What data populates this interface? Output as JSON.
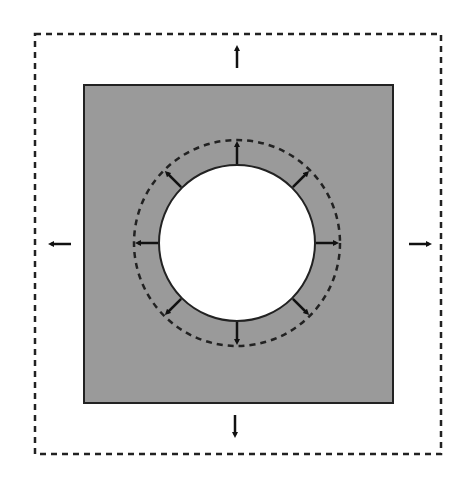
{
  "diagram": {
    "colors": {
      "background": "#ffffff",
      "plate_fill": "#9a9a9a",
      "plate_stroke": "#222222",
      "hole_fill": "#ffffff",
      "arrow": "#111111",
      "dashed": "#222222"
    },
    "outer_boundary": {
      "x": 35,
      "y": 34,
      "width": 406,
      "height": 420,
      "style": "dashed"
    },
    "plate": {
      "x": 84,
      "y": 85,
      "width": 309,
      "height": 318
    },
    "hole": {
      "cx": 237,
      "cy": 243,
      "r": 78
    },
    "expanded_hole": {
      "cx": 237,
      "cy": 243,
      "r": 103,
      "style": "dashed"
    },
    "outer_arrows": [
      {
        "name": "up",
        "x1": 237,
        "y1": 68,
        "x2": 237,
        "y2": 48
      },
      {
        "name": "down",
        "x1": 235,
        "y1": 415,
        "x2": 235,
        "y2": 435
      },
      {
        "name": "left",
        "x1": 71,
        "y1": 244,
        "x2": 51,
        "y2": 244
      },
      {
        "name": "right",
        "x1": 409,
        "y1": 244,
        "x2": 429,
        "y2": 244
      }
    ],
    "hole_arrows_count": 8
  }
}
